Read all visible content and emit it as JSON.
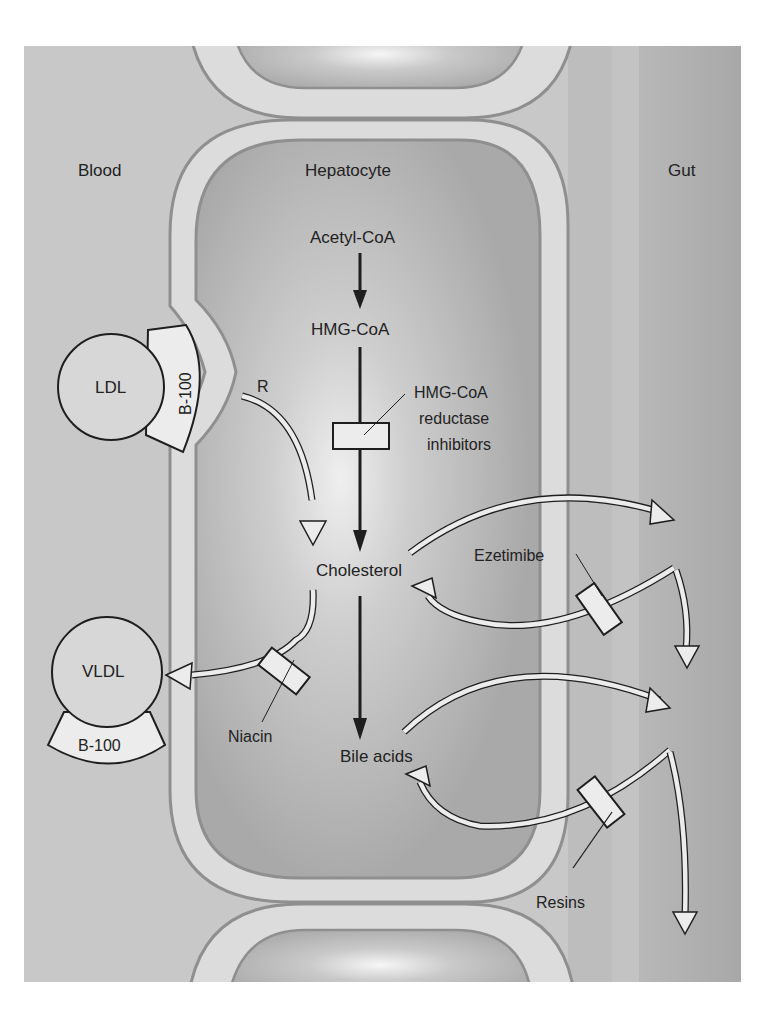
{
  "diagram": {
    "regions": {
      "blood": "Blood",
      "hepatocyte": "Hepatocyte",
      "gut": "Gut"
    },
    "pathway": {
      "acetyl_coa": "Acetyl-CoA",
      "hmg_coa": "HMG-CoA",
      "cholesterol": "Cholesterol",
      "bile_acids": "Bile acids"
    },
    "lipoproteins": {
      "ldl": "LDL",
      "ldl_apo": "B-100",
      "vldl": "VLDL",
      "vldl_apo": "B-100",
      "receptor": "R"
    },
    "drugs": {
      "statin_line1": "HMG-CoA",
      "statin_line2": "reductase",
      "statin_line3": "inhibitors",
      "ezetimibe": "Ezetimibe",
      "niacin": "Niacin",
      "resins": "Resins"
    },
    "colors": {
      "blood_bg": "#c9c9c9",
      "membrane": "#dcdcdc",
      "membrane_line": "#8f8f8f",
      "cytoplasm": "#b4b4b4",
      "gut_bg": "#a9a9a9",
      "gut_strip": "#c4c4c4",
      "shape_fill": "#ececec",
      "stroke": "#1e1e1e"
    }
  }
}
